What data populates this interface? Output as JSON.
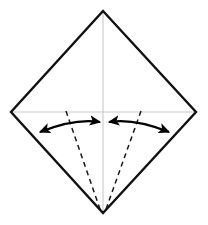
{
  "figure": {
    "canvas": {
      "width": 208,
      "height": 225
    },
    "background_color": "#ffffff"
  },
  "colors": {
    "outline": "#111111",
    "crease_guide": "#c9c9c9",
    "fold_dashed": "#1a1a1a",
    "arrow": "#000000"
  },
  "shapes": {
    "diamond": {
      "name": "paper-outline",
      "stroke_color": "#111111",
      "stroke_width": 2.4,
      "fill": "none",
      "points": "103,11 196,112 103,213 11,112",
      "vertices": {
        "top": [
          103,
          11
        ],
        "right": [
          196,
          112
        ],
        "bottom": [
          103,
          213
        ],
        "left": [
          11,
          112
        ]
      }
    },
    "vertical_guide": {
      "name": "vertical-center-crease",
      "stroke_color": "#c9c9c9",
      "stroke_width": 1.1,
      "x1": 103,
      "y1": 11,
      "x2": 103,
      "y2": 213
    },
    "horizontal_guide": {
      "name": "horizontal-center-crease",
      "stroke_color": "#c9c9c9",
      "stroke_width": 1.1,
      "x1": 11,
      "y1": 112,
      "x2": 196,
      "y2": 112
    },
    "dashed_folds": [
      {
        "name": "left-valley-fold",
        "stroke_color": "#1a1a1a",
        "stroke_width": 1.5,
        "dash": "5 4",
        "x1": 66,
        "y1": 111,
        "x2": 101,
        "y2": 212
      },
      {
        "name": "right-valley-fold",
        "stroke_color": "#1a1a1a",
        "stroke_width": 1.5,
        "dash": "5 4",
        "x1": 141,
        "y1": 111,
        "x2": 105,
        "y2": 212
      }
    ],
    "arrows": [
      {
        "name": "left-fold-arrow",
        "stroke_color": "#000000",
        "stroke_width": 2.2,
        "path": "M 40,132 Q 75,118 100,122",
        "head_start": {
          "x": 37,
          "y": 133,
          "angle_deg": 203
        },
        "head_end": {
          "x": 102,
          "y": 122,
          "angle_deg": 9
        },
        "double_headed": true
      },
      {
        "name": "right-fold-arrow",
        "stroke_color": "#000000",
        "stroke_width": 2.2,
        "path": "M 169,132 Q 134,118 109,122",
        "head_start": {
          "x": 172,
          "y": 133,
          "angle_deg": 337
        },
        "head_end": {
          "x": 107,
          "y": 122,
          "angle_deg": 171
        },
        "double_headed": true
      }
    ]
  },
  "labels": {
    "figure_caption": ""
  }
}
